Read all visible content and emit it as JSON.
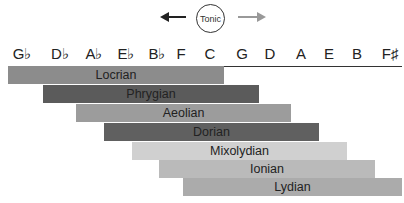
{
  "header": {
    "tonic_label": "Tonic",
    "left_arrow": "arrow-left (flat direction)",
    "right_arrow": "arrow-right (sharp direction)"
  },
  "notes": [
    {
      "label": "G♭",
      "x": 22
    },
    {
      "label": "D♭",
      "x": 60
    },
    {
      "label": "A♭",
      "x": 94
    },
    {
      "label": "E♭",
      "x": 126
    },
    {
      "label": "B♭",
      "x": 157
    },
    {
      "label": "F",
      "x": 181
    },
    {
      "label": "C",
      "x": 210
    },
    {
      "label": "G",
      "x": 242
    },
    {
      "label": "D",
      "x": 270
    },
    {
      "label": "A",
      "x": 301
    },
    {
      "label": "E",
      "x": 329
    },
    {
      "label": "B",
      "x": 357
    },
    {
      "label": "F♯",
      "x": 390
    }
  ],
  "modes": [
    {
      "name": "Locrian",
      "left": 8,
      "right": 224,
      "top": 66,
      "color": "#8c8c8c",
      "label_center": 124
    },
    {
      "name": "Phrygian",
      "left": 43,
      "right": 259,
      "top": 85,
      "color": "#5b5b5b",
      "label_center": 153
    },
    {
      "name": "Aeolian",
      "left": 76,
      "right": 291,
      "top": 104,
      "color": "#9c9c9c",
      "label_center": 183
    },
    {
      "name": "Dorian",
      "left": 104,
      "right": 319,
      "top": 123,
      "color": "#606060",
      "label_center": 212
    },
    {
      "name": "Mixolydian",
      "left": 132,
      "right": 347,
      "top": 142,
      "color": "#d0d0d0",
      "label_center": 240
    },
    {
      "name": "Ionian",
      "left": 159,
      "right": 375,
      "top": 160,
      "color": "#bababa",
      "label_center": 266
    },
    {
      "name": "Lydian",
      "left": 183,
      "right": 402,
      "top": 178,
      "color": "#ababab",
      "label_center": 293
    }
  ],
  "colors": {
    "arrow_left": "#222222",
    "arrow_right": "#999999",
    "axis": "#333333"
  }
}
